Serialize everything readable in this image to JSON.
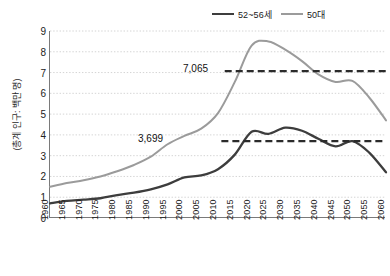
{
  "legend": {
    "position": "top-right",
    "entries": [
      {
        "label": "52~56세",
        "color": "#3d3d3d"
      },
      {
        "label": "50대",
        "color": "#9b9b9b"
      }
    ]
  },
  "axes": {
    "ylabel": "(총계 인구: 백만 명)",
    "xlabel": "",
    "yticks": [
      "0",
      "1",
      "2",
      "3",
      "4",
      "5",
      "6",
      "7",
      "8",
      "9"
    ],
    "xticks": [
      "1960",
      "1965",
      "1970",
      "1975",
      "1980",
      "1985",
      "1990",
      "1995",
      "2000",
      "2005",
      "2010",
      "2015",
      "2020",
      "2025",
      "2030",
      "2035",
      "2040",
      "2045",
      "2050",
      "2055",
      "2060"
    ]
  },
  "annotations": [
    {
      "name": "peak-50s-label",
      "text": "7,065",
      "value": 7.065
    },
    {
      "name": "peak-52-56-label",
      "text": "3,699",
      "value": 3.699
    }
  ],
  "chart_data": {
    "type": "line",
    "title": "",
    "xlabel": "",
    "ylabel": "(총계 인구: 백만 명)",
    "xlim": [
      1960,
      2060
    ],
    "ylim": [
      0,
      9
    ],
    "grid": "horizontal-dotted",
    "legend_position": "top-right",
    "x": [
      1960,
      1965,
      1970,
      1975,
      1980,
      1985,
      1990,
      1995,
      2000,
      2005,
      2010,
      2015,
      2020,
      2025,
      2030,
      2035,
      2040,
      2045,
      2050,
      2055,
      2060
    ],
    "series": [
      {
        "name": "52~56세",
        "color": "#3d3d3d",
        "values": [
          0.7,
          0.82,
          0.88,
          0.95,
          1.1,
          1.22,
          1.38,
          1.62,
          1.95,
          2.05,
          2.35,
          3.05,
          4.15,
          4.05,
          4.35,
          4.2,
          3.8,
          3.45,
          3.7,
          3.15,
          2.2
        ]
      },
      {
        "name": "50대",
        "color": "#9b9b9b",
        "values": [
          1.5,
          1.68,
          1.82,
          2.0,
          2.25,
          2.55,
          2.95,
          3.55,
          3.95,
          4.3,
          5.05,
          6.55,
          8.3,
          8.5,
          8.1,
          7.55,
          6.9,
          6.55,
          6.6,
          5.8,
          4.7
        ]
      }
    ],
    "reference_lines": [
      {
        "label": "7,065",
        "y": 7.065,
        "from_x": 2012,
        "to_x": 2060,
        "style": "dashed",
        "color": "#2b2b2b"
      },
      {
        "label": "3,699",
        "y": 3.699,
        "from_x": 2011,
        "to_x": 2060,
        "style": "dashed",
        "color": "#2b2b2b"
      }
    ]
  }
}
